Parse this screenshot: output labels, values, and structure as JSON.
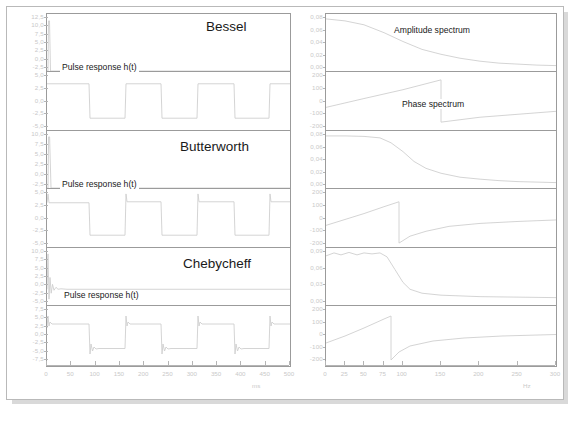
{
  "figure": {
    "background_color": "#ffffff",
    "frame_color": "#9b9b9b",
    "trace_color": "#cfcfcf",
    "text_color": "#1a1a1a",
    "tick_text_color": "#c9c9c9"
  },
  "filters": [
    {
      "name": "Bessel",
      "pulse_label": "Pulse response h(t)",
      "step_yticks": [
        "12,5",
        "10,0",
        "7,5",
        "5,0",
        "2,5",
        "0,0",
        "-2,5"
      ],
      "step_ylim": [
        -3.75,
        13.75
      ],
      "pulse_yticks": [
        "5,0",
        "2,5",
        "0,0",
        "-2,5",
        "-5,0"
      ],
      "pulse_ylim": [
        -6.25,
        6.25
      ],
      "amp_yticks": [
        "0,08",
        "0,06",
        "0,04",
        "0,02",
        "0,00"
      ],
      "amp_ylim": [
        -0.005,
        0.09
      ],
      "phase_yticks": [
        "200",
        "100",
        "0",
        "-100",
        "-200"
      ],
      "phase_ylim": [
        -250,
        250
      ]
    },
    {
      "name": "Butterworth",
      "pulse_label": "Pulse response h(t)",
      "step_yticks": [
        "10,0",
        "7,5",
        "5,0",
        "2,5",
        "0,0",
        "-2,5"
      ],
      "step_ylim": [
        -3.75,
        11.25
      ],
      "pulse_yticks": [
        "5,0",
        "2,5",
        "0,0",
        "-2,5",
        "-5,0"
      ],
      "pulse_ylim": [
        -6.25,
        6.25
      ],
      "amp_yticks": [
        "0,08",
        "0,06",
        "0,04",
        "0,02",
        "0,00"
      ],
      "amp_ylim": [
        -0.005,
        0.09
      ],
      "phase_yticks": [
        "200",
        "100",
        "0",
        "-100",
        "-200"
      ],
      "phase_ylim": [
        -250,
        250
      ]
    },
    {
      "name": "Chebycheff",
      "pulse_label": "Pulse response h(t)",
      "step_yticks": [
        "10,0",
        "7,5",
        "5,0",
        "2,5",
        "0,0",
        "-2,5",
        "-5,0"
      ],
      "step_ylim": [
        -6.25,
        11.25
      ],
      "pulse_yticks": [
        "7,5",
        "5,0",
        "2,5",
        "0,0",
        "-2,5",
        "-5,0",
        "-7,5"
      ],
      "pulse_ylim": [
        -8.75,
        8.75
      ],
      "amp_yticks": [
        "0,09",
        "0,06",
        "0,03",
        "0,00"
      ],
      "amp_ylim": [
        -0.006,
        0.105
      ],
      "phase_yticks": [
        "200",
        "100",
        "0",
        "-100",
        "-200"
      ],
      "phase_ylim": [
        -250,
        250
      ]
    }
  ],
  "axes": {
    "time": {
      "unit": "ms",
      "ticks": [
        "0",
        "50",
        "100",
        "150",
        "200",
        "250",
        "300",
        "350",
        "400",
        "450",
        "500"
      ],
      "values": [
        0,
        50,
        100,
        150,
        200,
        250,
        300,
        350,
        400,
        450,
        500
      ],
      "range": [
        0,
        500
      ]
    },
    "freq": {
      "unit": "Hz",
      "ticks": [
        "0",
        "25",
        "50",
        "75",
        "100",
        "150",
        "200",
        "250",
        "300"
      ],
      "values": [
        0,
        25,
        50,
        75,
        100,
        150,
        200,
        250,
        300
      ],
      "range": [
        0,
        300
      ]
    }
  },
  "annotations": {
    "amplitude_spectrum": "Amplitude spectrum",
    "phase_spectrum": "Phase spectrum"
  },
  "chart_data": {
    "type": "line",
    "title": "",
    "layout": "3 filter rows x (step response, pulse response) left column; (amplitude spectrum, phase spectrum) right column",
    "grid": false,
    "legend": "none",
    "panels": [
      {
        "filter": "Bessel",
        "panel": "step-response",
        "xlabel": "ms",
        "ylabel": "",
        "xlim": [
          0,
          500
        ],
        "ylim": [
          -3.75,
          13.75
        ],
        "yticks": [
          12.5,
          10.0,
          7.5,
          5.0,
          2.5,
          0.0,
          -2.5
        ],
        "description": "near-zero flat trace with a single narrow spike at t=0 rising to about 10",
        "x": [
          0,
          2,
          5,
          500
        ],
        "y": [
          0,
          10,
          0,
          0
        ]
      },
      {
        "filter": "Bessel",
        "panel": "pulse-response",
        "xlabel": "ms",
        "ylabel": "",
        "xlim": [
          0,
          500
        ],
        "ylim": [
          -6.25,
          6.25
        ],
        "yticks": [
          5.0,
          2.5,
          0.0,
          -2.5,
          -5.0
        ],
        "description": "clean square wave, no overshoot, period 150 ms, high 3.7, low -3.7",
        "x": [
          0,
          90,
          95,
          165,
          170,
          245,
          250,
          320,
          325,
          400,
          405,
          475,
          480,
          500
        ],
        "y": [
          3.7,
          3.7,
          -3.7,
          -3.7,
          3.7,
          3.7,
          -3.7,
          -3.7,
          3.7,
          3.7,
          -3.7,
          -3.7,
          3.7,
          3.7
        ]
      },
      {
        "filter": "Bessel",
        "panel": "amplitude-spectrum",
        "xlabel": "Hz",
        "ylabel": "",
        "xlim": [
          0,
          300
        ],
        "ylim": [
          -0.005,
          0.09
        ],
        "yticks": [
          0.08,
          0.06,
          0.04,
          0.02,
          0.0
        ],
        "description": "gentle monotonic rolloff from 0.077 at DC to near 0.004 at 300 Hz, -3 dB near 100 Hz",
        "x": [
          0,
          25,
          50,
          75,
          100,
          125,
          150,
          175,
          200,
          250,
          300
        ],
        "y": [
          0.077,
          0.074,
          0.068,
          0.056,
          0.042,
          0.029,
          0.02,
          0.014,
          0.01,
          0.006,
          0.004
        ]
      },
      {
        "filter": "Bessel",
        "panel": "phase-spectrum",
        "xlabel": "Hz",
        "ylabel": "",
        "xlim": [
          0,
          300
        ],
        "ylim": [
          -250,
          250
        ],
        "yticks": [
          200,
          100,
          0,
          -100,
          -200
        ],
        "description": "linear rising ramp from -55 deg to +180 deg, wraps down to -175 at 150 Hz, then rises slowly to -20",
        "x": [
          0,
          50,
          100,
          150,
          150,
          200,
          250,
          300
        ],
        "y": [
          -55,
          20,
          100,
          180,
          -175,
          -110,
          -70,
          -40
        ]
      },
      {
        "filter": "Butterworth",
        "panel": "step-response",
        "xlabel": "ms",
        "ylabel": "",
        "xlim": [
          0,
          500
        ],
        "ylim": [
          -3.75,
          11.25
        ],
        "yticks": [
          10.0,
          7.5,
          5.0,
          2.5,
          0.0,
          -2.5
        ],
        "description": "flat near zero with narrow spike at t=0 reaching about 9",
        "x": [
          0,
          2,
          6,
          500
        ],
        "y": [
          0,
          9,
          0,
          0
        ]
      },
      {
        "filter": "Butterworth",
        "panel": "pulse-response",
        "xlabel": "ms",
        "ylabel": "",
        "xlim": [
          0,
          500
        ],
        "ylim": [
          -6.25,
          6.25
        ],
        "yticks": [
          5.0,
          2.5,
          0.0,
          -2.5,
          -5.0
        ],
        "description": "square wave with small overshoot spikes at each rising edge, high 3.7, low -3.7",
        "x": [
          0,
          90,
          95,
          165,
          170,
          245,
          250,
          320,
          325,
          400,
          405,
          475,
          480,
          500
        ],
        "y": [
          3.7,
          3.7,
          -3.7,
          -3.7,
          4.6,
          3.7,
          -3.7,
          -3.7,
          4.6,
          3.7,
          -3.7,
          -3.7,
          4.6,
          3.7
        ]
      },
      {
        "filter": "Butterworth",
        "panel": "amplitude-spectrum",
        "xlabel": "Hz",
        "ylabel": "",
        "xlim": [
          0,
          300
        ],
        "ylim": [
          -0.005,
          0.09
        ],
        "yticks": [
          0.08,
          0.06,
          0.04,
          0.02,
          0.0
        ],
        "description": "maximally flat passband to about 70 Hz then steep rolloff, cutoff near 100 Hz",
        "x": [
          0,
          25,
          50,
          70,
          85,
          100,
          115,
          130,
          150,
          175,
          200,
          250,
          300
        ],
        "y": [
          0.077,
          0.077,
          0.076,
          0.073,
          0.062,
          0.044,
          0.028,
          0.018,
          0.011,
          0.007,
          0.005,
          0.003,
          0.002
        ]
      },
      {
        "filter": "Butterworth",
        "panel": "phase-spectrum",
        "xlabel": "Hz",
        "ylabel": "",
        "xlim": [
          0,
          300
        ],
        "ylim": [
          -250,
          250
        ],
        "yticks": [
          200,
          100,
          0,
          -100,
          -200
        ],
        "description": "rising ramp from -60 to +150 deg, wraps at about 95 Hz to -215 then curves up toward -30",
        "x": [
          0,
          25,
          50,
          75,
          95,
          95,
          110,
          130,
          160,
          200,
          250,
          300
        ],
        "y": [
          -60,
          -10,
          45,
          105,
          150,
          -215,
          -155,
          -115,
          -85,
          -60,
          -42,
          -30
        ]
      },
      {
        "filter": "Chebycheff",
        "panel": "step-response",
        "xlabel": "ms",
        "ylabel": "",
        "xlim": [
          0,
          500
        ],
        "ylim": [
          -6.25,
          11.25
        ],
        "yticks": [
          10.0,
          7.5,
          5.0,
          2.5,
          0.0,
          -2.5,
          -5.0
        ],
        "description": "spike at t=0 to about 9 followed by damped ringing decaying to zero",
        "x": [
          0,
          3,
          8,
          14,
          20,
          28,
          40,
          60,
          500
        ],
        "y": [
          0,
          9,
          -2.5,
          1.6,
          -1.0,
          0.6,
          -0.3,
          0,
          0
        ]
      },
      {
        "filter": "Chebycheff",
        "panel": "pulse-response",
        "xlabel": "ms",
        "ylabel": "",
        "xlim": [
          0,
          500
        ],
        "ylim": [
          -8.75,
          8.75
        ],
        "yticks": [
          7.5,
          5.0,
          2.5,
          0.0,
          -2.5,
          -5.0,
          -7.5
        ],
        "description": "square wave with pronounced overshoot and ringing at every transition, high 3.7 low -3.7",
        "x": [
          0,
          90,
          95,
          165,
          170,
          245,
          250,
          320,
          325,
          400,
          405,
          475,
          480,
          500
        ],
        "y": [
          3.7,
          3.7,
          -5.6,
          -3.7,
          5.6,
          3.7,
          -5.6,
          -3.7,
          5.6,
          3.7,
          -5.6,
          -3.7,
          5.6,
          3.7
        ]
      },
      {
        "filter": "Chebycheff",
        "panel": "amplitude-spectrum",
        "xlabel": "Hz",
        "ylabel": "",
        "xlim": [
          0,
          300
        ],
        "ylim": [
          -0.006,
          0.105
        ],
        "yticks": [
          0.09,
          0.06,
          0.03,
          0.0
        ],
        "description": "equiripple passband with visible ripple up to 80 Hz then very steep rolloff",
        "x": [
          0,
          10,
          20,
          30,
          40,
          50,
          60,
          70,
          80,
          90,
          100,
          110,
          125,
          150,
          200,
          250,
          300
        ],
        "y": [
          0.084,
          0.088,
          0.086,
          0.089,
          0.086,
          0.088,
          0.087,
          0.088,
          0.084,
          0.06,
          0.032,
          0.018,
          0.01,
          0.006,
          0.003,
          0.002,
          0.002
        ]
      },
      {
        "filter": "Chebycheff",
        "panel": "phase-spectrum",
        "xlabel": "Hz",
        "ylabel": "",
        "xlim": [
          0,
          300
        ],
        "ylim": [
          -250,
          250
        ],
        "yticks": [
          200,
          100,
          0,
          -100,
          -200
        ],
        "description": "rising ramp from -70 to +190 deg, sharp wrap at about 85 Hz to -230 then asymptotic rise to -30",
        "x": [
          0,
          25,
          50,
          75,
          85,
          85,
          95,
          110,
          140,
          180,
          230,
          300
        ],
        "y": [
          -70,
          -5,
          75,
          160,
          190,
          -230,
          -175,
          -125,
          -85,
          -60,
          -45,
          -33
        ]
      }
    ]
  }
}
